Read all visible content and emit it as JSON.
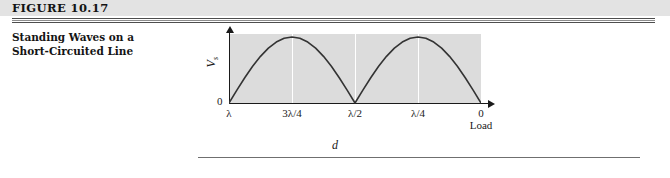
{
  "header": {
    "figure_number": "FIGURE 10.17",
    "band_color": "#e3e3e3",
    "rule_color": "#4e4e4e"
  },
  "caption": {
    "line1": "Standing Waves on a",
    "line2": "Short-Circuited Line"
  },
  "chart_data": {
    "type": "line",
    "title": "Standing Waves on a Short-Circuited Line",
    "xlabel": "d",
    "ylabel": "V_s",
    "y_origin_label": "0",
    "axis_end_label": "0",
    "load_label": "Load",
    "x_tick_labels": [
      "λ",
      "3λ/4",
      "λ/2",
      "λ/4",
      "0"
    ],
    "x_tick_positions": [
      0,
      0.25,
      0.5,
      0.75,
      1.0
    ],
    "x_direction_note": "distance d decreases from λ at left to 0 at load (right)",
    "xlim": [
      0,
      1
    ],
    "ylim": [
      0,
      1
    ],
    "grid": "vertical white gridlines at each tick",
    "panel_color": "#dcdcdc",
    "curve_color": "#333333",
    "series": [
      {
        "name": "|Vs| standing wave magnitude",
        "description": "rectified sine, |sin(2πd/λ)|, two arches",
        "x": [
          0.0,
          0.03125,
          0.0625,
          0.09375,
          0.125,
          0.15625,
          0.1875,
          0.21875,
          0.25,
          0.28125,
          0.3125,
          0.34375,
          0.375,
          0.40625,
          0.4375,
          0.46875,
          0.5,
          0.53125,
          0.5625,
          0.59375,
          0.625,
          0.65625,
          0.6875,
          0.71875,
          0.75,
          0.78125,
          0.8125,
          0.84375,
          0.875,
          0.90625,
          0.9375,
          0.96875,
          1.0
        ],
        "values": [
          0.0,
          0.195,
          0.383,
          0.556,
          0.707,
          0.831,
          0.924,
          0.981,
          1.0,
          0.981,
          0.924,
          0.831,
          0.707,
          0.556,
          0.383,
          0.195,
          0.0,
          0.195,
          0.383,
          0.556,
          0.707,
          0.831,
          0.924,
          0.981,
          1.0,
          0.981,
          0.924,
          0.831,
          0.707,
          0.556,
          0.383,
          0.195,
          0.0
        ]
      }
    ],
    "annotations": [
      {
        "text": "0",
        "role": "y-axis origin"
      },
      {
        "text": "Load",
        "role": "right end of axis"
      },
      {
        "text": "d",
        "role": "overall distance dimension below plot"
      }
    ]
  },
  "dimension": {
    "label": "d",
    "rule_color": "#6f6f6f"
  }
}
